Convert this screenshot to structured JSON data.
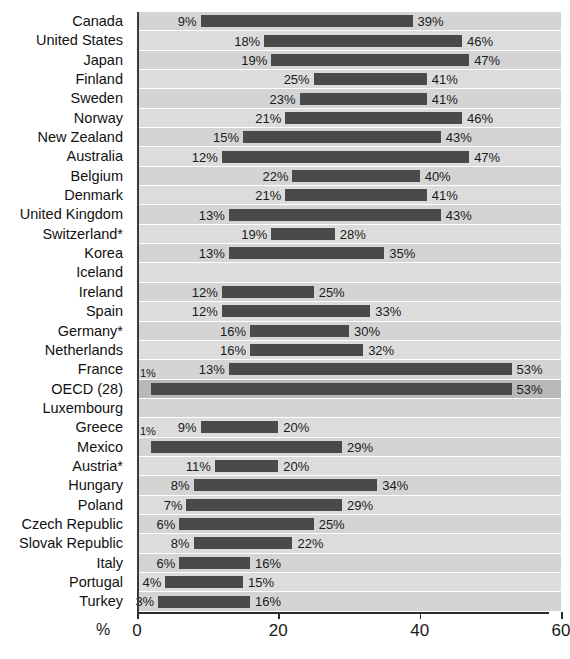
{
  "chart_data": {
    "type": "bar",
    "subtype": "floating-range-bar",
    "title": "",
    "xlabel": "%",
    "ylabel": "",
    "xlim": [
      0,
      60
    ],
    "xticks": [
      0,
      20,
      40,
      60
    ],
    "xtick_labels": [
      "0",
      "20",
      "40",
      "60"
    ],
    "grid": false,
    "legend": null,
    "unit_label": "%",
    "value_suffix": "%",
    "categories": [
      "Canada",
      "United States",
      "Japan",
      "Finland",
      "Sweden",
      "Norway",
      "New Zealand",
      "Australia",
      "Belgium",
      "Denmark",
      "United Kingdom",
      "Switzerland*",
      "Korea",
      "Iceland",
      "Ireland",
      "Spain",
      "Germany*",
      "Netherlands",
      "France",
      "OECD (28)",
      "Luxembourg",
      "Greece",
      "Mexico",
      "Austria*",
      "Hungary",
      "Poland",
      "Czech Republic",
      "Slovak Republic",
      "Italy",
      "Portugal",
      "Turkey"
    ],
    "rows": [
      {
        "label": "Canada",
        "start": 9,
        "end": 39,
        "start_label": "9%",
        "end_label": "39%",
        "extra_label": null,
        "highlight": false
      },
      {
        "label": "United States",
        "start": 18,
        "end": 46,
        "start_label": "18%",
        "end_label": "46%",
        "extra_label": null,
        "highlight": false
      },
      {
        "label": "Japan",
        "start": 19,
        "end": 47,
        "start_label": "19%",
        "end_label": "47%",
        "extra_label": null,
        "highlight": false
      },
      {
        "label": "Finland",
        "start": 25,
        "end": 41,
        "start_label": "25%",
        "end_label": "41%",
        "extra_label": null,
        "highlight": false
      },
      {
        "label": "Sweden",
        "start": 23,
        "end": 41,
        "start_label": "23%",
        "end_label": "41%",
        "extra_label": null,
        "highlight": false
      },
      {
        "label": "Norway",
        "start": 21,
        "end": 46,
        "start_label": "21%",
        "end_label": "46%",
        "extra_label": null,
        "highlight": false
      },
      {
        "label": "New Zealand",
        "start": 15,
        "end": 43,
        "start_label": "15%",
        "end_label": "43%",
        "extra_label": null,
        "highlight": false
      },
      {
        "label": "Australia",
        "start": 12,
        "end": 47,
        "start_label": "12%",
        "end_label": "47%",
        "extra_label": null,
        "highlight": false
      },
      {
        "label": "Belgium",
        "start": 22,
        "end": 40,
        "start_label": "22%",
        "end_label": "40%",
        "extra_label": null,
        "highlight": false
      },
      {
        "label": "Denmark",
        "start": 21,
        "end": 41,
        "start_label": "21%",
        "end_label": "41%",
        "extra_label": null,
        "highlight": false
      },
      {
        "label": "United Kingdom",
        "start": 13,
        "end": 43,
        "start_label": "13%",
        "end_label": "43%",
        "extra_label": null,
        "highlight": false
      },
      {
        "label": "Switzerland*",
        "start": 19,
        "end": 28,
        "start_label": "19%",
        "end_label": "28%",
        "extra_label": null,
        "highlight": false
      },
      {
        "label": "Korea",
        "start": 13,
        "end": 35,
        "start_label": "13%",
        "end_label": "35%",
        "extra_label": null,
        "highlight": false
      },
      {
        "label": "Iceland",
        "start": null,
        "end": null,
        "start_label": null,
        "end_label": null,
        "extra_label": null,
        "highlight": false
      },
      {
        "label": "Ireland",
        "start": 12,
        "end": 25,
        "start_label": "12%",
        "end_label": "25%",
        "extra_label": null,
        "highlight": false
      },
      {
        "label": "Spain",
        "start": 12,
        "end": 33,
        "start_label": "12%",
        "end_label": "33%",
        "extra_label": null,
        "highlight": false
      },
      {
        "label": "Germany*",
        "start": 16,
        "end": 30,
        "start_label": "16%",
        "end_label": "30%",
        "extra_label": null,
        "highlight": false
      },
      {
        "label": "Netherlands",
        "start": 16,
        "end": 32,
        "start_label": "16%",
        "end_label": "32%",
        "extra_label": null,
        "highlight": false
      },
      {
        "label": "France",
        "start": 13,
        "end": 53,
        "start_label": "13%",
        "end_label": "53%",
        "extra_label": "1%",
        "highlight": false
      },
      {
        "label": "OECD (28)",
        "start": 2,
        "end": 53,
        "start_label": null,
        "end_label": "53%",
        "extra_label": null,
        "highlight": true
      },
      {
        "label": "Luxembourg",
        "start": null,
        "end": null,
        "start_label": null,
        "end_label": null,
        "extra_label": null,
        "highlight": false
      },
      {
        "label": "Greece",
        "start": 9,
        "end": 20,
        "start_label": "9%",
        "end_label": "20%",
        "extra_label": "1%",
        "highlight": false
      },
      {
        "label": "Mexico",
        "start": 2,
        "end": 29,
        "start_label": null,
        "end_label": "29%",
        "extra_label": null,
        "highlight": false
      },
      {
        "label": "Austria*",
        "start": 11,
        "end": 20,
        "start_label": "11%",
        "end_label": "20%",
        "extra_label": null,
        "highlight": false
      },
      {
        "label": "Hungary",
        "start": 8,
        "end": 34,
        "start_label": "8%",
        "end_label": "34%",
        "extra_label": null,
        "highlight": false
      },
      {
        "label": "Poland",
        "start": 7,
        "end": 29,
        "start_label": "7%",
        "end_label": "29%",
        "extra_label": null,
        "highlight": false
      },
      {
        "label": "Czech Republic",
        "start": 6,
        "end": 25,
        "start_label": "6%",
        "end_label": "25%",
        "extra_label": null,
        "highlight": false
      },
      {
        "label": "Slovak Republic",
        "start": 8,
        "end": 22,
        "start_label": "8%",
        "end_label": "22%",
        "extra_label": null,
        "highlight": false
      },
      {
        "label": "Italy",
        "start": 6,
        "end": 16,
        "start_label": "6%",
        "end_label": "16%",
        "extra_label": null,
        "highlight": false
      },
      {
        "label": "Portugal",
        "start": 4,
        "end": 15,
        "start_label": "4%",
        "end_label": "15%",
        "extra_label": null,
        "highlight": false
      },
      {
        "label": "Turkey",
        "start": 3,
        "end": 16,
        "start_label": "3%",
        "end_label": "16%",
        "extra_label": null,
        "highlight": false
      }
    ],
    "colors": {
      "bar": "#4a4a4a",
      "plot_background": "#d8d8d8",
      "band_background": "#d4d4d4",
      "highlight_background": "#b8b8b8",
      "axis": "#2b2b2b",
      "text": "#1a1a1a"
    }
  }
}
